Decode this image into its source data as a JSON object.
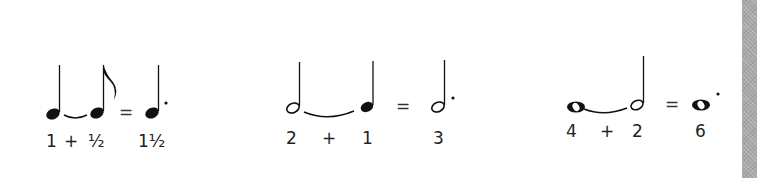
{
  "figure": {
    "colors": {
      "ink": "#111111",
      "text": "#222222",
      "sidebar": "#a9a9a9",
      "background": "#ffffff"
    },
    "equations": [
      {
        "left_note": "quarter-note",
        "right_note": "eighth-note",
        "result_note": "dotted-quarter-note",
        "equals": "=",
        "labels": {
          "left": "1",
          "plus": "+",
          "right": "½",
          "result": "1½"
        }
      },
      {
        "left_note": "half-note",
        "right_note": "quarter-note",
        "result_note": "dotted-half-note",
        "equals": "=",
        "labels": {
          "left": "2",
          "plus": "+",
          "right": "1",
          "result": "3"
        }
      },
      {
        "left_note": "whole-note",
        "right_note": "half-note",
        "result_note": "dotted-whole-note",
        "equals": "=",
        "labels": {
          "left": "4",
          "plus": "+",
          "right": "2",
          "result": "6"
        }
      }
    ]
  }
}
